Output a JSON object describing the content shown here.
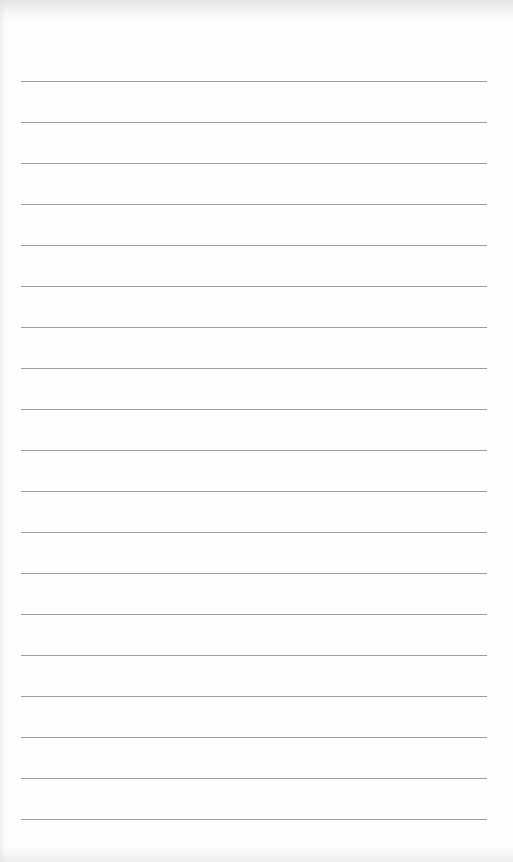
{
  "page": {
    "type": "blank lined paper",
    "line_count": 19,
    "line_color": "#8c8c8c",
    "background_color": "#fdfdfd",
    "lines": [
      {
        "y": 81
      },
      {
        "y": 122
      },
      {
        "y": 163
      },
      {
        "y": 204
      },
      {
        "y": 245
      },
      {
        "y": 286
      },
      {
        "y": 327
      },
      {
        "y": 368
      },
      {
        "y": 409
      },
      {
        "y": 450
      },
      {
        "y": 491
      },
      {
        "y": 532
      },
      {
        "y": 573
      },
      {
        "y": 614
      },
      {
        "y": 655
      },
      {
        "y": 696
      },
      {
        "y": 737
      },
      {
        "y": 778
      },
      {
        "y": 819
      }
    ]
  }
}
